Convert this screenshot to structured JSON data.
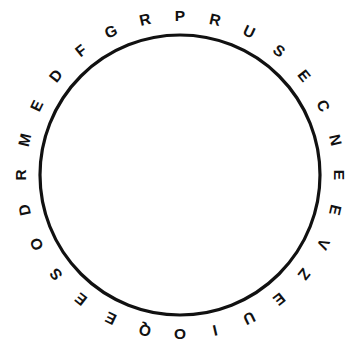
{
  "figure": {
    "background_color": "#ffffff"
  },
  "circle": {
    "center_x": 180,
    "center_y": 175,
    "radius": 140,
    "stroke_color": "#111111",
    "stroke_width": 3.2,
    "fill_color": "#ffffff"
  },
  "ring": {
    "letter_radius": 159,
    "letter_color": "#111111",
    "letter_count": 28,
    "start_angle_deg": -90,
    "direction": "clockwise",
    "sequence_clockwise": "PRUSECNEEVZEUIOQEESODRMEDFGR",
    "letters": [
      {
        "char": "P",
        "angle_deg": -90
      },
      {
        "char": "R",
        "angle_deg": -77.14
      },
      {
        "char": "U",
        "angle_deg": -64.29
      },
      {
        "char": "S",
        "angle_deg": -51.43
      },
      {
        "char": "E",
        "angle_deg": -38.57
      },
      {
        "char": "C",
        "angle_deg": -25.71
      },
      {
        "char": "N",
        "angle_deg": -12.86
      },
      {
        "char": "E",
        "angle_deg": 0
      },
      {
        "char": "E",
        "angle_deg": 12.86
      },
      {
        "char": "V",
        "angle_deg": 25.71
      },
      {
        "char": "Z",
        "angle_deg": 38.57
      },
      {
        "char": "E",
        "angle_deg": 51.43
      },
      {
        "char": "U",
        "angle_deg": 64.29
      },
      {
        "char": "I",
        "angle_deg": 77.14
      },
      {
        "char": "O",
        "angle_deg": 90
      },
      {
        "char": "Q",
        "angle_deg": 102.86
      },
      {
        "char": "E",
        "angle_deg": 115.71
      },
      {
        "char": "E",
        "angle_deg": 128.57
      },
      {
        "char": "S",
        "angle_deg": 141.43
      },
      {
        "char": "O",
        "angle_deg": 154.29
      },
      {
        "char": "D",
        "angle_deg": 167.14
      },
      {
        "char": "R",
        "angle_deg": 180
      },
      {
        "char": "M",
        "angle_deg": 192.86
      },
      {
        "char": "E",
        "angle_deg": 205.71
      },
      {
        "char": "D",
        "angle_deg": 218.57
      },
      {
        "char": "F",
        "angle_deg": 231.43
      },
      {
        "char": "G",
        "angle_deg": 244.29
      },
      {
        "char": "R",
        "angle_deg": 257.14
      }
    ]
  }
}
